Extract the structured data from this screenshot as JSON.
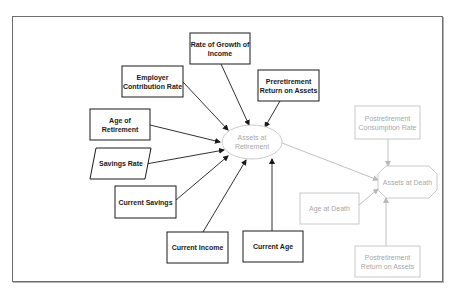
{
  "diagram": {
    "colors": {
      "dark_stroke": "#1a1a1a",
      "light_stroke": "#b9b9b9",
      "frame": "#6e6e6e",
      "background": "#ffffff"
    },
    "nodes": {
      "rate_growth_income": {
        "label": "Rate of Growth of Income",
        "shape": "rectangle",
        "style": "dark"
      },
      "employer_contribution": {
        "label": "Employer Contribution Rate",
        "shape": "rectangle",
        "style": "dark"
      },
      "preretirement_return": {
        "label": "Preretirement Return on Assets",
        "shape": "rectangle",
        "style": "dark"
      },
      "age_of_retirement": {
        "label": "Age of Retirement",
        "shape": "rectangle",
        "style": "dark"
      },
      "savings_rate": {
        "label": "Savings Rate",
        "shape": "parallelogram",
        "style": "dark"
      },
      "current_savings": {
        "label": "Current Savings",
        "shape": "rectangle",
        "style": "dark"
      },
      "current_income": {
        "label": "Current Income",
        "shape": "rectangle",
        "style": "dark"
      },
      "current_age": {
        "label": "Current Age",
        "shape": "rectangle",
        "style": "dark"
      },
      "assets_at_retirement": {
        "label": "Assets at Retirement",
        "shape": "ellipse",
        "style": "light"
      },
      "postretirement_consumption": {
        "label": "Postretirement Consumption Rate",
        "shape": "rectangle",
        "style": "light"
      },
      "assets_at_death": {
        "label": "Assets at Death",
        "shape": "octagon",
        "style": "light"
      },
      "age_at_death": {
        "label": "Age at Death",
        "shape": "rectangle",
        "style": "light"
      },
      "postretirement_return": {
        "label": "Postretirement Return on Assets",
        "shape": "rectangle",
        "style": "light"
      }
    },
    "edges": [
      {
        "from": "rate_growth_income",
        "to": "assets_at_retirement"
      },
      {
        "from": "employer_contribution",
        "to": "assets_at_retirement"
      },
      {
        "from": "preretirement_return",
        "to": "assets_at_retirement"
      },
      {
        "from": "age_of_retirement",
        "to": "assets_at_retirement"
      },
      {
        "from": "savings_rate",
        "to": "assets_at_retirement"
      },
      {
        "from": "current_savings",
        "to": "assets_at_retirement"
      },
      {
        "from": "current_income",
        "to": "assets_at_retirement"
      },
      {
        "from": "current_age",
        "to": "assets_at_retirement"
      },
      {
        "from": "assets_at_retirement",
        "to": "assets_at_death"
      },
      {
        "from": "postretirement_consumption",
        "to": "assets_at_death"
      },
      {
        "from": "age_at_death",
        "to": "assets_at_death"
      },
      {
        "from": "postretirement_return",
        "to": "assets_at_death"
      }
    ]
  }
}
